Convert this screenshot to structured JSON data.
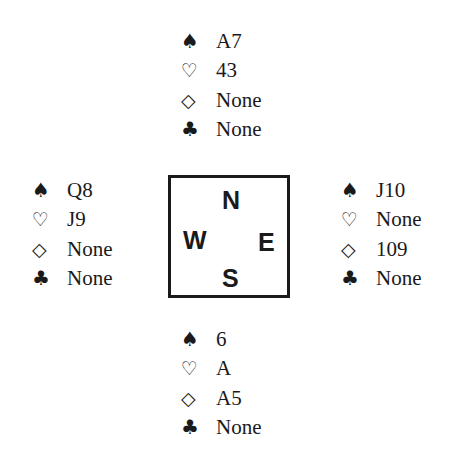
{
  "suits": {
    "spades": {
      "symbol": "♠",
      "icon": "spade-icon"
    },
    "hearts": {
      "symbol": "♡",
      "icon": "heart-outline-icon"
    },
    "diamonds": {
      "symbol": "◇",
      "icon": "diamond-outline-icon"
    },
    "clubs": {
      "symbol": "♣",
      "icon": "club-icon"
    }
  },
  "compass": {
    "north": "N",
    "west": "W",
    "east": "E",
    "south": "S"
  },
  "hands": {
    "north": {
      "spades": "A7",
      "hearts": "43",
      "diamonds": "None",
      "clubs": "None"
    },
    "west": {
      "spades": "Q8",
      "hearts": "J9",
      "diamonds": "None",
      "clubs": "None"
    },
    "east": {
      "spades": "J10",
      "hearts": "None",
      "diamonds": "109",
      "clubs": "None"
    },
    "south": {
      "spades": "6",
      "hearts": "A",
      "diamonds": "A5",
      "clubs": "None"
    }
  }
}
